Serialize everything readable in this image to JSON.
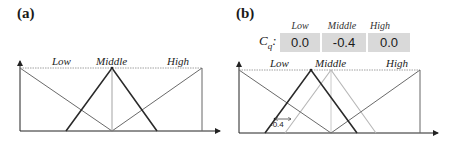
{
  "panels": [
    {
      "id": "a",
      "label": "(a)",
      "terms": [
        "Low",
        "Middle",
        "High"
      ]
    },
    {
      "id": "b",
      "label": "(b)",
      "terms": [
        "Low",
        "Middle",
        "High"
      ],
      "cq": {
        "symbol": "C",
        "subscript": "q",
        "suffix": ":",
        "headers": [
          "Low",
          "Middle",
          "High"
        ],
        "values": [
          "0.0",
          "-0.4",
          "0.0"
        ]
      },
      "shift_annotation": "-0.4"
    }
  ],
  "colors": {
    "line_dark": "#2a2a2a",
    "line_mid": "#6a6a6a",
    "line_light": "#b8b8b8",
    "dotted": "#888888",
    "cell_bg": "#d9d9d9"
  }
}
